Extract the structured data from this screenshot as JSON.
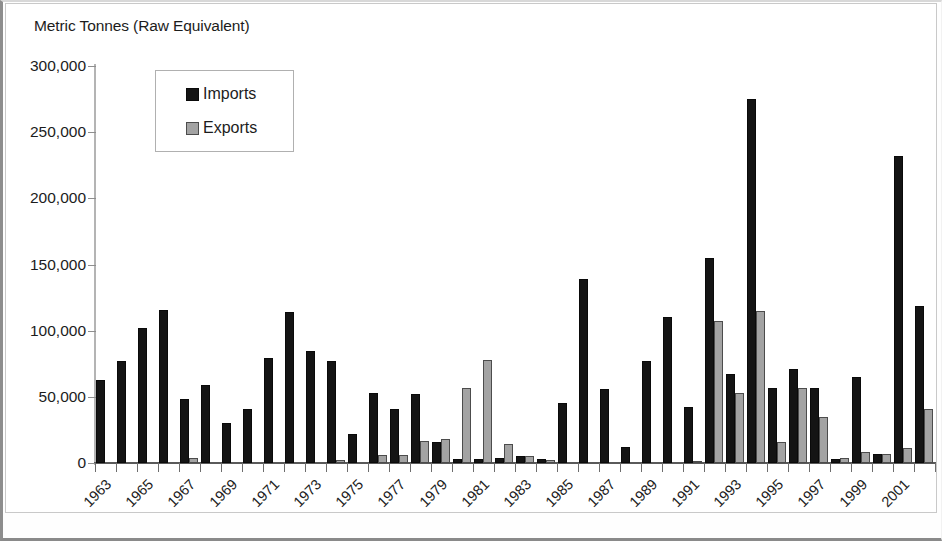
{
  "chart_data": {
    "type": "bar",
    "title": "Metric Tonnes (Raw Equivalent)",
    "xlabel": "",
    "ylabel": "Metric Tonnes (Raw Equivalent)",
    "ylim": [
      0,
      300000
    ],
    "ytick_labels": [
      "300,000",
      "250,000",
      "200,000",
      "150,000",
      "100,000",
      "50,000",
      "0"
    ],
    "ytick_values": [
      300000,
      250000,
      200000,
      150000,
      100000,
      50000,
      0
    ],
    "grid": false,
    "legend_position": "top-left-inside",
    "categories": [
      "1963",
      "1964",
      "1965",
      "1966",
      "1967",
      "1968",
      "1969",
      "1970",
      "1971",
      "1972",
      "1973",
      "1974",
      "1975",
      "1976",
      "1977",
      "1978",
      "1979",
      "1980",
      "1981",
      "1982",
      "1983",
      "1984",
      "1985",
      "1986",
      "1987",
      "1988",
      "1989",
      "1990",
      "1991",
      "1992",
      "1993",
      "1994",
      "1995",
      "1996",
      "1997",
      "1998",
      "1999",
      "2000",
      "2001",
      "2002"
    ],
    "xtick_labels": [
      "1963",
      "1965",
      "1967",
      "1969",
      "1971",
      "1973",
      "1975",
      "1977",
      "1979",
      "1981",
      "1983",
      "1985",
      "1987",
      "1989",
      "1991",
      "1993",
      "1995",
      "1997",
      "1999",
      "2001"
    ],
    "series": [
      {
        "name": "Imports",
        "color": "#141414",
        "values": [
          63000,
          77000,
          102000,
          116000,
          48000,
          59000,
          30000,
          41000,
          79000,
          114000,
          85000,
          77000,
          22000,
          53000,
          41000,
          52000,
          16000,
          3000,
          3000,
          4000,
          5000,
          3000,
          45000,
          139000,
          56000,
          12000,
          77000,
          110000,
          42000,
          155000,
          67000,
          275000,
          57000,
          71000,
          57000,
          3000,
          65000,
          7000,
          232000,
          119000
        ]
      },
      {
        "name": "Exports",
        "color": "#a3a3a3",
        "values": [
          0,
          0,
          0,
          0,
          4000,
          0,
          0,
          0,
          0,
          0,
          0,
          2000,
          0,
          6000,
          6000,
          17000,
          18000,
          57000,
          78000,
          14000,
          5000,
          2000,
          0,
          0,
          0,
          0,
          0,
          0,
          1000,
          107000,
          53000,
          115000,
          16000,
          57000,
          35000,
          4000,
          8000,
          7000,
          11000,
          41000
        ]
      }
    ]
  },
  "legend": {
    "items": [
      {
        "label": "Imports",
        "color": "#141414"
      },
      {
        "label": "Exports",
        "color": "#a3a3a3"
      }
    ]
  }
}
